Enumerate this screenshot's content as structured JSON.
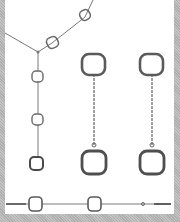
{
  "image": {
    "subject": "jewelry set",
    "items": [
      {
        "name": "necklace",
        "links": 5
      },
      {
        "name": "earring-left",
        "links": 2
      },
      {
        "name": "earring-right",
        "links": 2
      },
      {
        "name": "bracelet",
        "links": 2
      }
    ],
    "colors": {
      "background": "#ffffff",
      "frame": "#b8b8b8",
      "metal": "#555555",
      "chain": "#7a7a7a"
    }
  }
}
